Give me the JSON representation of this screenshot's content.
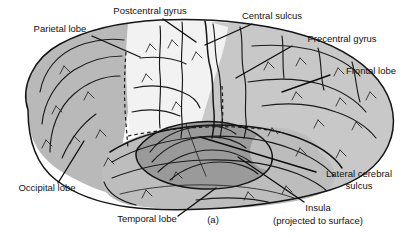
{
  "figure": {
    "caption": "(a)",
    "background_color": "#ffffff",
    "line_color": "#121212"
  },
  "palette": {
    "parietal_fill": "#f1f1f1",
    "frontal_fill": "#c8c8c8",
    "occipital_fill": "#b9b9b9",
    "temporal_fill": "#bdbdbd",
    "insula_fill": "#9a9a9a",
    "outline": "#151515",
    "text": "#121212"
  },
  "labels": [
    {
      "id": "parietal-lobe",
      "text": "Parietal lobe",
      "x": 60,
      "y": 32,
      "anchor": "middle"
    },
    {
      "id": "postcentral-gyrus",
      "text": "Postcentral gyrus",
      "x": 150,
      "y": 14,
      "anchor": "middle"
    },
    {
      "id": "central-sulcus",
      "text": "Central sulcus",
      "x": 272,
      "y": 19,
      "anchor": "middle"
    },
    {
      "id": "precentral-gyrus",
      "text": "Precentral gyrus",
      "x": 342,
      "y": 42,
      "anchor": "middle"
    },
    {
      "id": "frontal-lobe",
      "text": "Frontal lobe",
      "x": 371,
      "y": 74,
      "anchor": "middle"
    },
    {
      "id": "lateral-cerebral-sulcus-line1",
      "text": "Lateral cerebral",
      "x": 359,
      "y": 177,
      "anchor": "middle"
    },
    {
      "id": "lateral-cerebral-sulcus-line2",
      "text": "sulcus",
      "x": 359,
      "y": 189,
      "anchor": "middle"
    },
    {
      "id": "insula-line1",
      "text": "Insula",
      "x": 318,
      "y": 211,
      "anchor": "middle"
    },
    {
      "id": "insula-line2",
      "text": "(projected to surface)",
      "x": 318,
      "y": 224,
      "anchor": "middle"
    },
    {
      "id": "occipital-lobe",
      "text": "Occipital lobe",
      "x": 47,
      "y": 191,
      "anchor": "middle"
    },
    {
      "id": "temporal-lobe",
      "text": "Temporal lobe",
      "x": 147,
      "y": 222,
      "anchor": "middle"
    },
    {
      "id": "caption",
      "text": "(a)",
      "x": 213,
      "y": 223,
      "anchor": "middle"
    }
  ],
  "regions": [
    {
      "id": "parietal-lobe",
      "name": "Parietal lobe",
      "shade": "light"
    },
    {
      "id": "frontal-lobe",
      "name": "Frontal lobe",
      "shade": "medium"
    },
    {
      "id": "occipital-lobe",
      "name": "Occipital lobe",
      "shade": "medium-dark"
    },
    {
      "id": "temporal-lobe",
      "name": "Temporal lobe",
      "shade": "medium-dark"
    },
    {
      "id": "insula",
      "name": "Insula (projected to surface)",
      "shade": "dark"
    }
  ]
}
